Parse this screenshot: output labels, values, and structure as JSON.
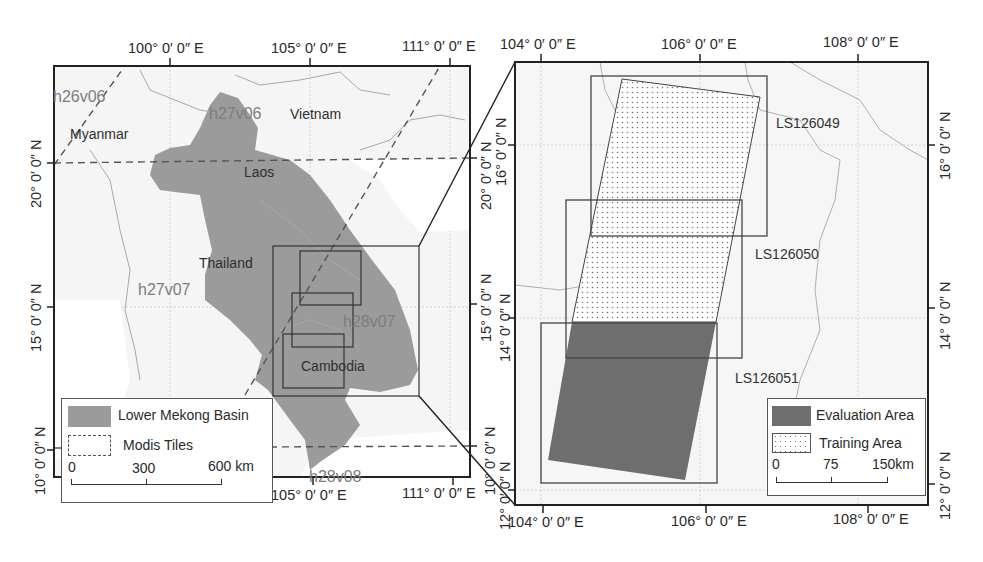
{
  "left_map": {
    "top_ticks": [
      "100° 0′ 0″ E",
      "105° 0′ 0″ E",
      "111° 0′ 0″ E"
    ],
    "bottom_ticks": [
      "100° 0′ 0″ E",
      "105° 0′ 0″ E",
      "111° 0′ 0″ E"
    ],
    "left_ticks": [
      "20° 0′ 0″ N",
      "15° 0′ 0″ N",
      "10° 0′ 0″ N"
    ],
    "right_ticks": [
      "20° 0′ 0″ N",
      "15° 0′ 0″ N",
      "10° 0′ 0″ N"
    ],
    "tiles": [
      "h26v06",
      "h27v06",
      "h27v07",
      "h28v07",
      "h28v08"
    ],
    "countries": [
      "Myanmar",
      "Vietnam",
      "Laos",
      "Thailand",
      "Cambodia"
    ],
    "legend": {
      "basin_label": "Lower Mekong Basin",
      "tiles_label": "Modis Tiles",
      "scale": [
        "0",
        "300",
        "600 km"
      ]
    },
    "colors": {
      "basin": "#9b9b9b",
      "land": "#f4f4f4",
      "frame": "#222222"
    }
  },
  "right_map": {
    "top_ticks": [
      "104° 0′ 0″ E",
      "106° 0′ 0″ E",
      "108° 0′ 0″ E"
    ],
    "bottom_ticks": [
      "104° 0′ 0″ E",
      "106° 0′ 0″ E",
      "108° 0′ 0″ E"
    ],
    "left_ticks": [
      "16° 0′ 0″ N",
      "14° 0′ 0″ N",
      "12° 0′ 0″ N"
    ],
    "right_ticks": [
      "16° 0′ 0″ N",
      "14° 0′ 0″ N",
      "12° 0′ 0″ N"
    ],
    "scenes": [
      "LS126049",
      "LS126050",
      "LS126051"
    ],
    "legend": {
      "evaluation_label": "Evaluation Area",
      "training_label": "Training Area",
      "scale": [
        "0",
        "75",
        "150km"
      ]
    },
    "colors": {
      "evaluation": "#6e6e6e",
      "training_dots": "#8a8a8a"
    }
  }
}
